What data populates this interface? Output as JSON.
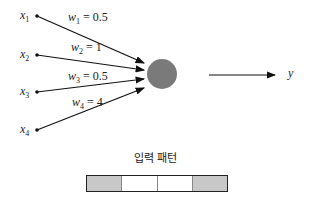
{
  "inputs": [
    {
      "name": "x",
      "sub": "1",
      "y": 16
    },
    {
      "name": "x",
      "sub": "2",
      "y": 55
    },
    {
      "name": "x",
      "sub": "3",
      "y": 92
    },
    {
      "name": "x",
      "sub": "4",
      "y": 130
    }
  ],
  "weights": [
    {
      "name": "w",
      "sub": "1",
      "eq": " = 0.5"
    },
    {
      "name": "w",
      "sub": "2",
      "eq": " = 1"
    },
    {
      "name": "w",
      "sub": "3",
      "eq": " = 0.5"
    },
    {
      "name": "w",
      "sub": "4",
      "eq": " = 4"
    }
  ],
  "output": {
    "label": "y"
  },
  "neuron": {
    "fill": "#7a7a7a"
  },
  "pattern": {
    "title": "입력 패턴",
    "cells": [
      "#c8c8c8",
      "#ffffff",
      "#ffffff",
      "#c8c8c8"
    ]
  }
}
